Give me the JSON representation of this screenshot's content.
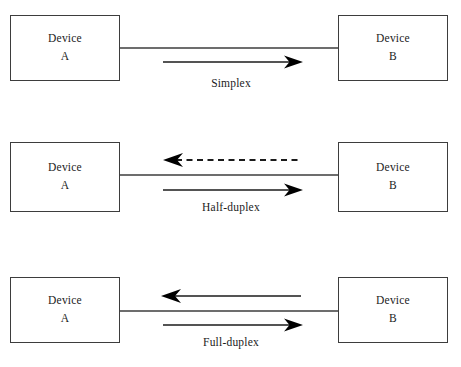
{
  "diagram": {
    "stroke_color": "#3d3d3d",
    "arrow_color": "#000000",
    "background_color": "#ffffff",
    "panels": [
      {
        "id": "simplex",
        "caption": "Simplex",
        "left_device": {
          "name": "Device",
          "id": "A"
        },
        "right_device": {
          "name": "Device",
          "id": "B"
        },
        "arrows": [
          {
            "direction": "right",
            "style": "solid",
            "position": "below-line"
          }
        ]
      },
      {
        "id": "half-duplex",
        "caption": "Half-duplex",
        "left_device": {
          "name": "Device",
          "id": "A"
        },
        "right_device": {
          "name": "Device",
          "id": "B"
        },
        "arrows": [
          {
            "direction": "left",
            "style": "dashed",
            "position": "above-line"
          },
          {
            "direction": "right",
            "style": "solid",
            "position": "below-line"
          }
        ]
      },
      {
        "id": "full-duplex",
        "caption": "Full-duplex",
        "left_device": {
          "name": "Device",
          "id": "A"
        },
        "right_device": {
          "name": "Device",
          "id": "B"
        },
        "arrows": [
          {
            "direction": "left",
            "style": "solid",
            "position": "above-line"
          },
          {
            "direction": "right",
            "style": "solid",
            "position": "below-line"
          }
        ]
      }
    ]
  }
}
